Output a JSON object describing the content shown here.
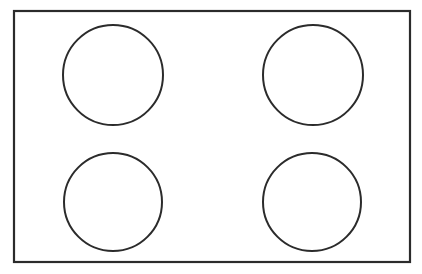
{
  "document": {
    "title": "Cooktop outline diagram",
    "background_color": "#ffffff",
    "width": 422,
    "height": 274
  },
  "figure": {
    "type": "line-drawing",
    "stroke_color": "#2b2b2b",
    "fill_color": "#ffffff",
    "panel": {
      "name": "outer-rectangle",
      "x": 14,
      "y": 11,
      "width": 396,
      "height": 251,
      "stroke_width": 2.2
    },
    "circles": [
      {
        "name": "circle-top-left",
        "position": "top-left",
        "cx": 113,
        "cy": 75,
        "r": 50,
        "stroke_width": 2
      },
      {
        "name": "circle-top-right",
        "position": "top-right",
        "cx": 313,
        "cy": 75,
        "r": 50,
        "stroke_width": 2
      },
      {
        "name": "circle-bottom-left",
        "position": "bottom-left",
        "cx": 113,
        "cy": 202,
        "r": 49,
        "stroke_width": 2
      },
      {
        "name": "circle-bottom-right",
        "position": "bottom-right",
        "cx": 312,
        "cy": 202,
        "r": 49,
        "stroke_width": 2
      }
    ]
  }
}
